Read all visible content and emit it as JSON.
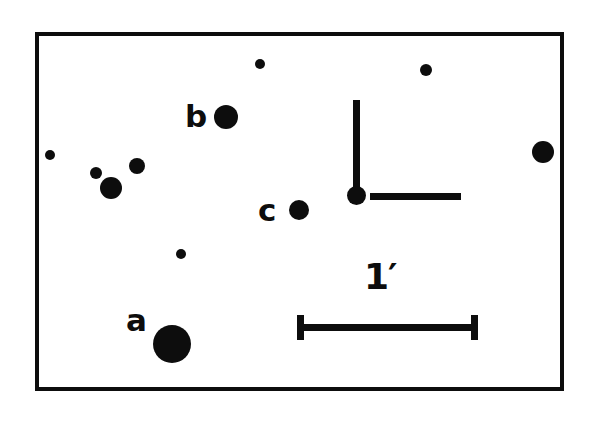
{
  "figure": {
    "kind": "astronomical-finder-chart",
    "background_color": "#ffffff",
    "ink_color": "#0d0d0d",
    "frame": {
      "x": 35,
      "y": 32,
      "width": 529,
      "height": 359,
      "border_width": 4
    }
  },
  "chart_data": {
    "type": "scatter",
    "title": "",
    "subtitle": "",
    "xlabel": "",
    "ylabel": "",
    "grid": false,
    "legend": "none",
    "axis_visible": false,
    "plot_area": {
      "x": 35,
      "y": 32,
      "width": 529,
      "height": 359
    },
    "marker_shape": "filled-circle",
    "marker_color": "#0d0d0d",
    "sources": [
      {
        "id": "s1",
        "label": "",
        "x": 260,
        "y": 64,
        "r": 5
      },
      {
        "id": "s2",
        "label": "",
        "x": 426,
        "y": 70,
        "r": 6
      },
      {
        "id": "b",
        "label": "b",
        "x": 226,
        "y": 117,
        "r": 12
      },
      {
        "id": "s4",
        "label": "",
        "x": 543,
        "y": 152,
        "r": 11
      },
      {
        "id": "s5",
        "label": "",
        "x": 50,
        "y": 155,
        "r": 5
      },
      {
        "id": "s6",
        "label": "",
        "x": 137,
        "y": 166,
        "r": 8
      },
      {
        "id": "s7",
        "label": "",
        "x": 96,
        "y": 173,
        "r": 6
      },
      {
        "id": "s8",
        "label": "",
        "x": 111,
        "y": 188,
        "r": 11
      },
      {
        "id": "c",
        "label": "c",
        "x": 299,
        "y": 210,
        "r": 10
      },
      {
        "id": "s10",
        "label": "",
        "x": 181,
        "y": 254,
        "r": 5
      },
      {
        "id": "a",
        "label": "a",
        "x": 172,
        "y": 344,
        "r": 19
      }
    ],
    "source_labels": [
      {
        "text": "b",
        "x": 185,
        "y": 101
      },
      {
        "text": "c",
        "x": 258,
        "y": 195
      },
      {
        "text": "a",
        "x": 126,
        "y": 305
      }
    ],
    "annotations": {
      "orientation_marker": {
        "name": "compass-orientation-marker",
        "origin": {
          "x": 357,
          "y": 196
        },
        "origin_dot_radius": 9,
        "vertical_arm": {
          "from_y": 100,
          "to_y": 190,
          "x": 357,
          "thickness": 7
        },
        "horizontal_arm": {
          "from_x": 370,
          "to_x": 461,
          "y": 197,
          "thickness": 7
        }
      },
      "scale_bar": {
        "name": "scale-bar",
        "label": "1′",
        "label_plain": "1'",
        "unit": "arcminute",
        "value": 1,
        "from_x": 297,
        "to_x": 478,
        "y": 327,
        "length_px": 181,
        "thickness": 7,
        "cap_height": 25
      }
    }
  }
}
